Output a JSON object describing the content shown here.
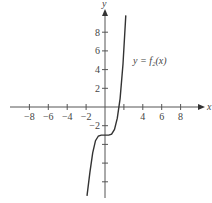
{
  "chart_data": {
    "type": "line",
    "title": "",
    "xlabel": "x",
    "ylabel": "y",
    "xlim": [
      -9.5,
      10.5
    ],
    "ylim": [
      -10,
      11
    ],
    "x_ticks": [
      -8,
      -6,
      -4,
      -2,
      2,
      4,
      6,
      8
    ],
    "x_tick_labels": [
      "−8",
      "−6",
      "−4",
      "−2",
      "",
      "4",
      "6",
      "8"
    ],
    "y_ticks": [
      -8,
      -6,
      -4,
      -2,
      2,
      4,
      6,
      8
    ],
    "y_tick_labels": [
      "",
      "",
      "",
      "−2",
      "2",
      "4",
      "6",
      "8"
    ],
    "grid": false,
    "series": [
      {
        "name": "y = f2(x)",
        "label": "y = f₂(x)",
        "description": "increasing curve with a flat inflection plateau near y = −3 around x = 0, crossing the x-axis near x ≈ 1.8",
        "x": [
          -1.9,
          -1.6,
          -1.3,
          -1.0,
          -0.7,
          -0.4,
          0,
          0.4,
          0.7,
          1.0,
          1.3,
          1.6,
          1.9,
          2.2
        ],
        "y": [
          -9.5,
          -7.0,
          -4.9,
          -3.6,
          -3.1,
          -3.0,
          -3.0,
          -3.0,
          -2.9,
          -2.4,
          -1.2,
          0.9,
          4.6,
          9.8
        ]
      }
    ]
  }
}
